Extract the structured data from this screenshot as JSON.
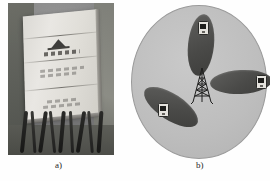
{
  "figure": {
    "panels": [
      {
        "id": "a",
        "caption": "a)",
        "kind": "photograph",
        "subject": "sectorized base-station antenna panel with coaxial feeder cables",
        "description": "Light-colored rectangular antenna panel mounted at an angle, divided by horizontal seams into four segments, bearing a dark triangular manufacturer logo and printed label text, with a bundle of dark coaxial cables hanging from its lower edge against a blurred outdoor background.",
        "photo": {
          "board_segments": 4,
          "logo_shape": "triangle",
          "cable_count": 9
        }
      },
      {
        "id": "b",
        "caption": "b)",
        "kind": "schematic",
        "subject": "tri-sector cell site coverage diagram",
        "description": "A circular cell area containing a central lattice antenna tower radiating three elliptical sector coverage lobes at roughly 120-degree spacing, each lobe containing a mobile handset.",
        "cell": {
          "shape": "circle",
          "sector_count": 3,
          "sector_separation_degrees": 120,
          "tower_icon": "lattice-tower",
          "sectors": [
            {
              "name": "north-sector",
              "bearing_degrees": 0,
              "device": "mobile-handset"
            },
            {
              "name": "east-sector",
              "bearing_degrees": 120,
              "device": "mobile-handset"
            },
            {
              "name": "southwest-sector",
              "bearing_degrees": 240,
              "device": "mobile-handset"
            }
          ]
        }
      }
    ]
  },
  "colors": {
    "cell_fill": "#bdbdbd",
    "lobe_fill": "#4a4a48",
    "tower_stroke": "#1f1f1e",
    "caption_text": "#262626",
    "panel_board": "#ded cd6"
  }
}
